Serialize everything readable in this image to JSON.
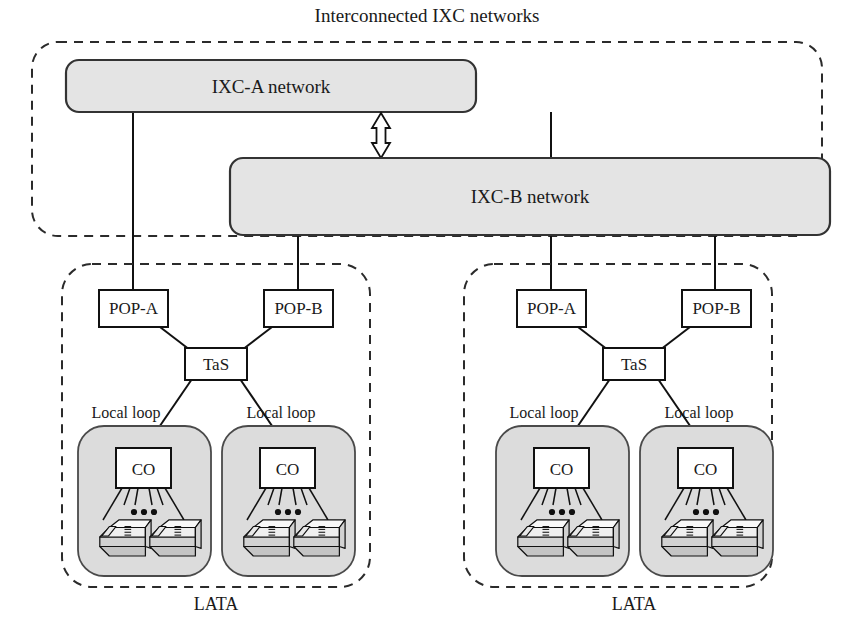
{
  "figure": {
    "title": "Interconnected IXC networks",
    "bottom_labels": [
      "LATA",
      "LATA"
    ]
  },
  "ixc": {
    "networks": [
      {
        "id": "ixc-a",
        "label": "IXC-A network"
      },
      {
        "id": "ixc-b",
        "label": "IXC-B network"
      }
    ],
    "interconnect_icon": "double-headed-arrow-icon"
  },
  "lata_regions": [
    {
      "id": "lata-left",
      "label": "LATA",
      "pops": [
        {
          "id": "pop-a",
          "label": "POP-A",
          "uplink": "IXC-A network"
        },
        {
          "id": "pop-b",
          "label": "POP-B",
          "uplink": "IXC-B network"
        }
      ],
      "tandem_switch": {
        "id": "tas",
        "label": "TaS"
      },
      "local_loops": [
        {
          "id": "local-loop-1",
          "label": "Local loop",
          "central_office": {
            "id": "co",
            "label": "CO"
          },
          "subscriber_count_icon": "ellipsis-icon",
          "subscribers": [
            "telephone-icon",
            "telephone-icon"
          ]
        },
        {
          "id": "local-loop-2",
          "label": "Local loop",
          "central_office": {
            "id": "co",
            "label": "CO"
          },
          "subscriber_count_icon": "ellipsis-icon",
          "subscribers": [
            "telephone-icon",
            "telephone-icon"
          ]
        }
      ]
    },
    {
      "id": "lata-right",
      "label": "LATA",
      "pops": [
        {
          "id": "pop-a",
          "label": "POP-A",
          "uplink": "IXC-A network"
        },
        {
          "id": "pop-b",
          "label": "POP-B",
          "uplink": "IXC-B network"
        }
      ],
      "tandem_switch": {
        "id": "tas",
        "label": "TaS"
      },
      "local_loops": [
        {
          "id": "local-loop-1",
          "label": "Local loop",
          "central_office": {
            "id": "co",
            "label": "CO"
          },
          "subscriber_count_icon": "ellipsis-icon",
          "subscribers": [
            "telephone-icon",
            "telephone-icon"
          ]
        },
        {
          "id": "local-loop-2",
          "label": "Local loop",
          "central_office": {
            "id": "co",
            "label": "CO"
          },
          "subscriber_count_icon": "ellipsis-icon",
          "subscribers": [
            "telephone-icon",
            "telephone-icon"
          ]
        }
      ]
    }
  ],
  "colors": {
    "ixc_fill": "#e4e4e4",
    "loop_fill": "#dcdcdc",
    "node_fill": "#ffffff",
    "stroke": "#111111",
    "background": "#ffffff"
  }
}
